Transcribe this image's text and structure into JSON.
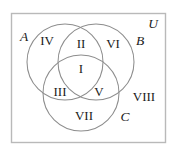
{
  "diagram": {
    "kind": "venn-diagram",
    "universe": {
      "label": "U",
      "border_color": "#b9b9b9"
    },
    "stroke_color": "#8d8d8d",
    "text_color": "#1b1b1b",
    "background": "#ffffff",
    "sets": [
      {
        "id": "set-a",
        "label": "A",
        "label_x": 24,
        "label_y": 38,
        "cx": 65,
        "cy": 62,
        "r": 38
      },
      {
        "id": "set-b",
        "label": "B",
        "label_x": 140,
        "label_y": 42,
        "cx": 96,
        "cy": 62,
        "r": 38
      },
      {
        "id": "set-c",
        "label": "C",
        "label_x": 125,
        "label_y": 118,
        "cx": 81,
        "cy": 93,
        "r": 38
      }
    ],
    "universe_label": {
      "label": "U",
      "label_x": 153,
      "label_y": 25
    },
    "regions": [
      {
        "id": "region-1",
        "label": "I",
        "x": 81,
        "y": 70,
        "meaning": "A and B and C"
      },
      {
        "id": "region-2",
        "label": "II",
        "x": 81,
        "y": 45,
        "meaning": "A and B only"
      },
      {
        "id": "region-3",
        "label": "III",
        "x": 60,
        "y": 93,
        "meaning": "A and C only"
      },
      {
        "id": "region-4",
        "label": "IV",
        "x": 47,
        "y": 42,
        "meaning": "A only"
      },
      {
        "id": "region-5",
        "label": "V",
        "x": 99,
        "y": 93,
        "meaning": "B and C only"
      },
      {
        "id": "region-6",
        "label": "VI",
        "x": 113,
        "y": 45,
        "meaning": "B only"
      },
      {
        "id": "region-7",
        "label": "VII",
        "x": 84,
        "y": 117,
        "meaning": "C only"
      },
      {
        "id": "region-8",
        "label": "VIII",
        "x": 144,
        "y": 98,
        "meaning": "outside A, B and C"
      }
    ]
  }
}
